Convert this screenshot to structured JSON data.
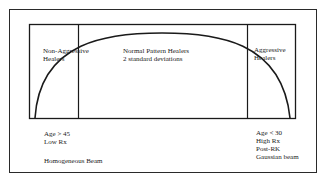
{
  "diagram": {
    "type": "bell-curve-categories",
    "regions": [
      {
        "id": "non-aggressive",
        "lines": [
          "Non-Aggressive",
          "Healers"
        ]
      },
      {
        "id": "normal",
        "lines": [
          "Normal Pattern Healers",
          "2 standard deviations"
        ]
      },
      {
        "id": "aggressive",
        "lines": [
          "Aggressive",
          "Healers"
        ]
      }
    ],
    "notes_left": {
      "lines": [
        "Age > 45",
        "Low Rx"
      ],
      "beam": "Homogeneous Beam"
    },
    "notes_right": {
      "lines": [
        "Age < 30",
        "High Rx",
        "Post-RK",
        "Gaussian beam"
      ]
    },
    "colors": {
      "stroke": "#1a1a1a",
      "background": "#ffffff"
    }
  }
}
